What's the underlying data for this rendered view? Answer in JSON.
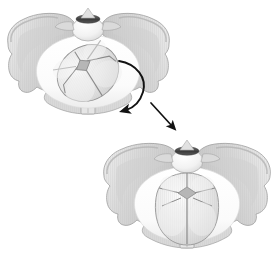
{
  "figure": {
    "title": "Fetal head internal rotation within the maternal pelvis",
    "type": "medical-illustration",
    "background_color": "#ffffff",
    "view": "pelvic inlet viewed from above",
    "panel_count": 2
  },
  "palette": {
    "bone_fill": "#d6d6d6",
    "bone_fill_light": "#e3e3e3",
    "bone_fill_dark": "#c2c2c2",
    "bone_outline": "#9a9a9a",
    "cavity_white": "#fdfdfd",
    "skull_fill": "#e8e8e8",
    "skull_highlight": "#f7f7f7",
    "suture_line": "#8f8f8f",
    "fontanelle_fill": "#b9b9b9",
    "promontory_dark": "#4a4a4a",
    "arrow_color": "#121212",
    "hatch_color": "#bfbfbf"
  },
  "panels": [
    {
      "id": "panel-upper",
      "name": "upper-pelvis-panel",
      "label": "Fetal head in transverse / oblique position at pelvic inlet",
      "position": {
        "x": 4,
        "y": 4,
        "width": 172,
        "height": 124
      },
      "pelvis": {
        "name": "maternal-pelvis-upper",
        "parts": [
          {
            "name": "left-iliac-wing",
            "label": "Left ilium"
          },
          {
            "name": "right-iliac-wing",
            "label": "Right ilium"
          },
          {
            "name": "sacral-promontory",
            "label": "Sacral promontory"
          },
          {
            "name": "sacrum-body",
            "label": "Sacral vertebral body"
          },
          {
            "name": "pubic-symphysis",
            "label": "Pubic symphysis"
          },
          {
            "name": "pelvic-inlet-cavity",
            "label": "Pelvic inlet"
          }
        ]
      },
      "fetal_head": {
        "name": "fetal-skull-upper",
        "orientation": "occiput transverse / left occiput anterior",
        "sagittal_suture_angle_deg": 55,
        "features": [
          {
            "name": "anterior-fontanelle",
            "label": "Anterior fontanelle (bregma)",
            "shape": "diamond"
          },
          {
            "name": "sagittal-suture",
            "label": "Sagittal suture"
          },
          {
            "name": "coronal-suture",
            "label": "Coronal suture"
          },
          {
            "name": "lambdoid-suture",
            "label": "Lambdoid suture"
          },
          {
            "name": "parietal-bone",
            "label": "Parietal bone"
          },
          {
            "name": "frontal-bone",
            "label": "Frontal bone"
          }
        ]
      }
    },
    {
      "id": "panel-lower",
      "name": "lower-pelvis-panel",
      "label": "Fetal head rotated to occiput anterior position",
      "position": {
        "x": 98,
        "y": 130,
        "width": 178,
        "height": 124
      },
      "pelvis": {
        "name": "maternal-pelvis-lower",
        "parts": [
          {
            "name": "left-iliac-wing",
            "label": "Left ilium"
          },
          {
            "name": "right-iliac-wing",
            "label": "Right ilium"
          },
          {
            "name": "sacral-promontory",
            "label": "Sacral promontory"
          },
          {
            "name": "sacrum-body",
            "label": "Sacral vertebral body"
          },
          {
            "name": "pubic-symphysis",
            "label": "Pubic symphysis"
          },
          {
            "name": "pelvic-inlet-cavity",
            "label": "Pelvic inlet"
          }
        ]
      },
      "fetal_head": {
        "name": "fetal-skull-lower",
        "orientation": "occiput anterior",
        "sagittal_suture_angle_deg": 0,
        "features": [
          {
            "name": "anterior-fontanelle",
            "label": "Anterior fontanelle (bregma)",
            "shape": "diamond"
          },
          {
            "name": "sagittal-suture",
            "label": "Sagittal suture"
          },
          {
            "name": "coronal-suture",
            "label": "Coronal suture"
          },
          {
            "name": "lambdoid-suture",
            "label": "Lambdoid suture"
          },
          {
            "name": "parietal-bone",
            "label": "Parietal bone"
          },
          {
            "name": "frontal-bone",
            "label": "Frontal bone"
          }
        ]
      }
    }
  ],
  "arrows": [
    {
      "name": "rotation-arrow",
      "label": "Internal rotation of fetal head",
      "style": "curved",
      "direction": "clockwise-then-down-left",
      "start": {
        "x": 121,
        "y": 62
      },
      "end": {
        "x": 124,
        "y": 110
      }
    },
    {
      "name": "descent-arrow",
      "label": "Descent to lower panel",
      "style": "straight",
      "direction": "down-right",
      "start": {
        "x": 152,
        "y": 106
      },
      "end": {
        "x": 175,
        "y": 129
      }
    }
  ]
}
